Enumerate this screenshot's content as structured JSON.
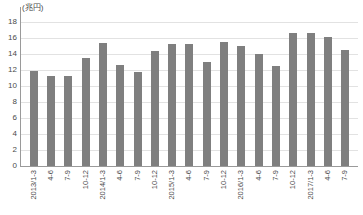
{
  "chart_data": {
    "type": "bar",
    "title": "",
    "subtitle": "",
    "unit_label": "(兆円)",
    "xlabel": "",
    "ylabel": "",
    "ylim": [
      0,
      18
    ],
    "ytick_step": 2,
    "yticks": [
      18,
      16,
      14,
      12,
      10,
      8,
      6,
      4,
      2,
      0
    ],
    "grid": true,
    "legend": null,
    "bar_color": "#7f7f7f",
    "gridline_color": "#e2e2e2",
    "axis_color": "#9a9a9a",
    "categories": [
      "2013/1-3",
      "4-6",
      "7-9",
      "10-12",
      "2014/1-3",
      "4-6",
      "7-9",
      "10-12",
      "2015/1-3",
      "4-6",
      "7-9",
      "10-12",
      "2016/1-3",
      "4-6",
      "7-9",
      "10-12",
      "2017/1-3",
      "4-6",
      "7-9"
    ],
    "values": [
      11.9,
      11.3,
      11.3,
      13.5,
      15.4,
      12.6,
      11.7,
      14.4,
      15.3,
      15.2,
      13.0,
      15.5,
      15.0,
      14.0,
      12.5,
      16.6,
      16.6,
      16.1,
      14.5
    ]
  }
}
